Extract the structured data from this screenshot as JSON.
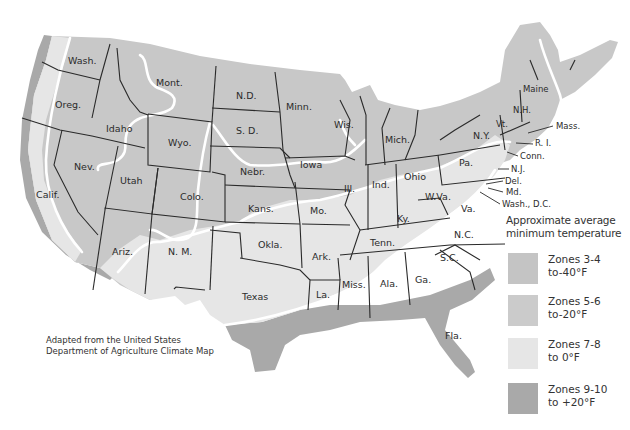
{
  "map": {
    "title": "USDA Climate Zones — Approximate average minimum temperature",
    "colors": {
      "zone_3_4": "#c4c4c4",
      "zone_5_6": "#cbcbcb",
      "zone_7_8": "#e6e6e6",
      "zone_9_10": "#a9a9a9",
      "borders": "#2a2a2a",
      "zone_lines": "#ffffff",
      "background": "#ffffff"
    },
    "states": [
      {
        "id": "wa",
        "label": "Wash."
      },
      {
        "id": "or",
        "label": "Oreg."
      },
      {
        "id": "ca",
        "label": "Calif."
      },
      {
        "id": "id",
        "label": "Idaho"
      },
      {
        "id": "nv",
        "label": "Nev."
      },
      {
        "id": "mt",
        "label": "Mont."
      },
      {
        "id": "wy",
        "label": "Wyo."
      },
      {
        "id": "ut",
        "label": "Utah"
      },
      {
        "id": "az",
        "label": "Ariz."
      },
      {
        "id": "co",
        "label": "Colo."
      },
      {
        "id": "nm",
        "label": "N. M."
      },
      {
        "id": "nd",
        "label": "N.D."
      },
      {
        "id": "sd",
        "label": "S. D."
      },
      {
        "id": "ne",
        "label": "Nebr."
      },
      {
        "id": "ks",
        "label": "Kans."
      },
      {
        "id": "ok",
        "label": "Okla."
      },
      {
        "id": "tx",
        "label": "Texas"
      },
      {
        "id": "mn",
        "label": "Minn."
      },
      {
        "id": "ia",
        "label": "Iowa"
      },
      {
        "id": "mo",
        "label": "Mo."
      },
      {
        "id": "ar",
        "label": "Ark."
      },
      {
        "id": "la",
        "label": "La."
      },
      {
        "id": "wi",
        "label": "Wis."
      },
      {
        "id": "il",
        "label": "Ill."
      },
      {
        "id": "mi",
        "label": "Mich."
      },
      {
        "id": "in",
        "label": "Ind."
      },
      {
        "id": "oh",
        "label": "Ohio"
      },
      {
        "id": "ky",
        "label": "Ky."
      },
      {
        "id": "tn",
        "label": "Tenn."
      },
      {
        "id": "ms",
        "label": "Miss."
      },
      {
        "id": "al",
        "label": "Ala."
      },
      {
        "id": "ga",
        "label": "Ga."
      },
      {
        "id": "fl",
        "label": "Fla."
      },
      {
        "id": "sc",
        "label": "S.C."
      },
      {
        "id": "nc",
        "label": "N.C."
      },
      {
        "id": "va",
        "label": "Va."
      },
      {
        "id": "wv",
        "label": "W.Va."
      },
      {
        "id": "pa",
        "label": "Pa."
      },
      {
        "id": "ny",
        "label": "N.Y."
      },
      {
        "id": "vt",
        "label": "Vt."
      },
      {
        "id": "nh",
        "label": "N.H."
      },
      {
        "id": "me",
        "label": "Maine"
      },
      {
        "id": "ma",
        "label": "Mass."
      },
      {
        "id": "ri",
        "label": "R. I."
      },
      {
        "id": "ct",
        "label": "Conn."
      },
      {
        "id": "nj",
        "label": "N.J."
      },
      {
        "id": "de",
        "label": "Del."
      },
      {
        "id": "md",
        "label": "Md."
      },
      {
        "id": "dc",
        "label": "Wash., D.C."
      }
    ]
  },
  "legend": {
    "title_line1": "Approximate average",
    "title_line2": "minimum temperature",
    "items": [
      {
        "zone": "Zones 3-4",
        "temp": "to-40°F",
        "color": "#c4c4c4"
      },
      {
        "zone": "Zones 5-6",
        "temp": "to-20°F",
        "color": "#cbcbcb"
      },
      {
        "zone": "Zones 7-8",
        "temp": "to 0°F",
        "color": "#e6e6e6"
      },
      {
        "zone": "Zones 9-10",
        "temp": "to +20°F",
        "color": "#a9a9a9"
      }
    ]
  },
  "credit": {
    "line1": "Adapted from the United States",
    "line2": "Department of Agriculture Climate Map"
  }
}
